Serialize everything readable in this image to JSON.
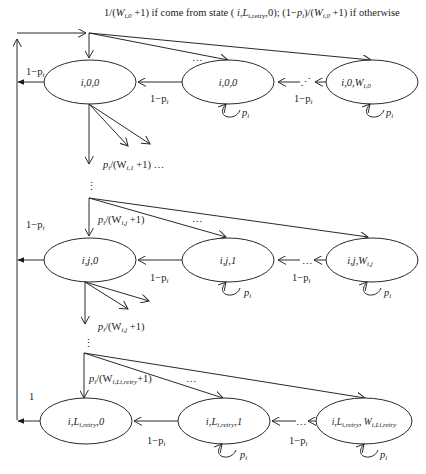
{
  "diagram": {
    "type": "markov-chain-state-diagram",
    "top_label": "1/(W_{i,0}+1) if come from state (i,L_{i,retry},0); (1−p_i)/(W_{i,0}+1) if otherwise",
    "top_label_parts": {
      "a": "1/(",
      "W": "W",
      "Wsub": "i,0",
      "b": " +1) if come from state ( ",
      "st": "i,L",
      "stsub": "i,retry",
      "c": ",0); (1−",
      "p": "p",
      "psub": "i",
      "d": ")/(",
      "W2": "W",
      "W2sub": "i,0",
      "e": " +1) if otherwise"
    },
    "rows": [
      {
        "stage": "0",
        "states": [
          {
            "label": "i,0,0"
          },
          {
            "label": "i,0,1"
          },
          {
            "label_main": "i,0,",
            "label_W": "W",
            "label_sub": "i,0"
          }
        ],
        "back_edge_label": "1−p",
        "back_edge_sub": "i",
        "backoff_label": "1−p",
        "backoff_sub": "i",
        "backoff_label2": "1−p",
        "backoff_sub2": "i",
        "self_loop": "p",
        "self_loop_sub": "i",
        "ellipsis_mid": "…",
        "ellipsis_between": "⋰",
        "down_label_p": "p",
        "down_label_psub": "i",
        "down_label_rest": "/(W",
        "down_label_Wsub": "i,1",
        "down_label_end": " +1) …"
      },
      {
        "stage": "j",
        "states": [
          {
            "label": "i,j,0"
          },
          {
            "label": "i,j,1"
          },
          {
            "label_main": "i,j,",
            "label_W": "W",
            "label_sub": "i,j"
          }
        ],
        "in_label_p": "p",
        "in_label_psub": "i",
        "in_label_rest": "/(W",
        "in_label_Wsub": "i,j",
        "in_label_end": " +1)",
        "back_edge_label": "1−p",
        "back_edge_sub": "i",
        "backoff_label": "1−p",
        "backoff_sub": "i",
        "backoff_label2": "1−p",
        "backoff_sub2": "i",
        "self_loop": "p",
        "self_loop_sub": "i",
        "ellipsis_mid": "…",
        "ellipsis_between": "…",
        "down_label_p": "p",
        "down_label_psub": "i",
        "down_label_rest": "/(W",
        "down_label_Wsub": "i,j",
        "down_label_end": " +1)"
      },
      {
        "stage": "L_{i,retry}",
        "states": [
          {
            "label_main": "i,L",
            "label_sub": "i,retry",
            "label_end": ",0"
          },
          {
            "label_main": "i,L",
            "label_sub": "i,retry",
            "label_end": ",1"
          },
          {
            "label_main": "i,L",
            "label_sub": "i,retry",
            "label_end": ", W",
            "label_sub2": "i,Li,retry"
          }
        ],
        "in_label_p": "p",
        "in_label_psub": "i",
        "in_label_rest": "/(W",
        "in_label_Wsub": "i,Li,retry",
        "in_label_end": "+1)",
        "back_edge_label": "1",
        "backoff_label": "1−p",
        "backoff_sub": "i",
        "backoff_label2": "1−p",
        "backoff_sub2": "i",
        "self_loop": "p",
        "self_loop_sub": "i",
        "ellipsis_mid": "…",
        "ellipsis_between": "…"
      }
    ],
    "vertical_ellipsis": "⋮",
    "colors": {
      "stroke": "#2a2a2a",
      "text": "#222222",
      "background": "#ffffff"
    }
  }
}
